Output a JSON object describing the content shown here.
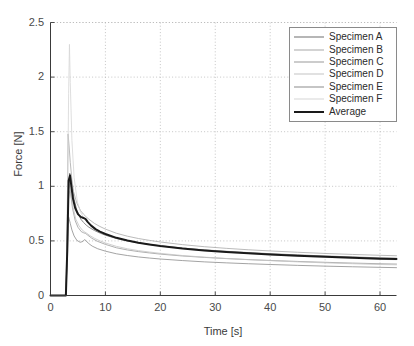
{
  "chart_data": {
    "type": "line",
    "title": "",
    "xlabel": "Time [s]",
    "ylabel": "Force [N]",
    "xlim": [
      0,
      63
    ],
    "ylim": [
      0,
      2.5
    ],
    "xticks": [
      0,
      10,
      20,
      30,
      40,
      50,
      60
    ],
    "xtick_labels": [
      "0",
      "10",
      "20",
      "30",
      "40",
      "50",
      "60"
    ],
    "yticks": [
      0,
      0.5,
      1,
      1.5,
      2,
      2.5
    ],
    "ytick_labels": [
      "0",
      "0.5",
      "1",
      "1.5",
      "2",
      "2.5"
    ],
    "grid": true,
    "grid_style": "dotted",
    "legend_position": "top-right",
    "background": "#ffffff",
    "series": [
      {
        "name": "Specimen A",
        "color": "#6e6e6e",
        "width": 0.8,
        "x": [
          0,
          1.0,
          2.0,
          2.8,
          3.0,
          3.2,
          3.5,
          3.8,
          4.0,
          4.3,
          4.8,
          5.5,
          6.0,
          6.5,
          7.0,
          8.0,
          9.0,
          10.0,
          12.0,
          14.0,
          16.0,
          18.0,
          20.0,
          24.0,
          28.0,
          32.0,
          36.0,
          40.0,
          45.0,
          50.0,
          55.0,
          60.0,
          63.0
        ],
        "y": [
          0.0,
          0.0,
          0.0,
          0.0,
          0.34,
          0.9,
          1.12,
          1.06,
          0.98,
          0.88,
          0.78,
          0.7,
          0.67,
          0.645,
          0.625,
          0.595,
          0.572,
          0.552,
          0.522,
          0.5,
          0.482,
          0.468,
          0.455,
          0.435,
          0.418,
          0.405,
          0.393,
          0.383,
          0.372,
          0.362,
          0.353,
          0.345,
          0.341
        ]
      },
      {
        "name": "Specimen B",
        "color": "#a8a8a8",
        "width": 0.8,
        "x": [
          0,
          1.0,
          2.0,
          2.8,
          3.0,
          3.2,
          3.4,
          3.6,
          3.9,
          4.2,
          4.8,
          5.5,
          6.0,
          6.5,
          7.0,
          8.0,
          9.0,
          10.0,
          12.0,
          14.0,
          16.0,
          18.0,
          20.0,
          24.0,
          28.0,
          32.0,
          36.0,
          40.0,
          45.0,
          50.0,
          55.0,
          60.0,
          63.0
        ],
        "y": [
          0.0,
          0.0,
          0.0,
          0.0,
          0.5,
          1.48,
          1.36,
          1.22,
          1.06,
          0.95,
          0.845,
          0.775,
          0.745,
          0.72,
          0.698,
          0.66,
          0.632,
          0.608,
          0.57,
          0.543,
          0.522,
          0.505,
          0.49,
          0.466,
          0.447,
          0.432,
          0.419,
          0.408,
          0.396,
          0.385,
          0.376,
          0.368,
          0.364
        ]
      },
      {
        "name": "Specimen C",
        "color": "#9a9a9a",
        "width": 0.8,
        "x": [
          0,
          1.0,
          2.0,
          2.8,
          3.05,
          3.25,
          3.45,
          3.7,
          4.0,
          4.5,
          5.0,
          5.6,
          6.0,
          6.4,
          6.8,
          7.5,
          8.5,
          10.0,
          12.0,
          14.0,
          16.0,
          18.0,
          20.0,
          24.0,
          28.0,
          32.0,
          36.0,
          40.0,
          45.0,
          50.0,
          55.0,
          60.0,
          63.0
        ],
        "y": [
          0.0,
          0.0,
          0.0,
          0.0,
          0.42,
          1.05,
          1.02,
          0.92,
          0.8,
          0.685,
          0.625,
          0.585,
          0.575,
          0.568,
          0.552,
          0.525,
          0.497,
          0.468,
          0.437,
          0.417,
          0.402,
          0.39,
          0.379,
          0.362,
          0.349,
          0.338,
          0.329,
          0.321,
          0.312,
          0.304,
          0.297,
          0.291,
          0.288
        ]
      },
      {
        "name": "Specimen D",
        "color": "#c4c4c4",
        "width": 0.8,
        "x": [
          0,
          1.0,
          2.0,
          2.8,
          3.1,
          3.3,
          3.5,
          3.8,
          4.1,
          4.6,
          5.2,
          5.8,
          6.2,
          6.6,
          7.2,
          8.0,
          9.0,
          10.0,
          12.0,
          14.0,
          16.0,
          18.0,
          20.0,
          24.0,
          28.0,
          32.0,
          36.0,
          40.0,
          45.0,
          50.0,
          55.0,
          60.0,
          63.0
        ],
        "y": [
          0.0,
          0.0,
          0.0,
          0.0,
          0.36,
          0.88,
          0.96,
          0.9,
          0.81,
          0.7,
          0.638,
          0.598,
          0.583,
          0.57,
          0.548,
          0.524,
          0.5,
          0.481,
          0.45,
          0.428,
          0.411,
          0.398,
          0.386,
          0.366,
          0.351,
          0.339,
          0.328,
          0.319,
          0.308,
          0.299,
          0.291,
          0.284,
          0.281
        ]
      },
      {
        "name": "Specimen E",
        "color": "#8c8c8c",
        "width": 0.8,
        "x": [
          0,
          1.0,
          2.0,
          2.8,
          3.0,
          3.3,
          3.6,
          3.9,
          4.3,
          4.8,
          5.4,
          5.9,
          6.2,
          6.5,
          6.9,
          7.6,
          8.6,
          10.0,
          12.0,
          14.0,
          16.0,
          18.0,
          20.0,
          24.0,
          28.0,
          32.0,
          36.0,
          40.0,
          45.0,
          50.0,
          55.0,
          60.0,
          63.0
        ],
        "y": [
          0.0,
          0.0,
          0.0,
          0.0,
          0.3,
          0.72,
          0.66,
          0.6,
          0.545,
          0.505,
          0.487,
          0.495,
          0.512,
          0.5,
          0.478,
          0.452,
          0.428,
          0.406,
          0.382,
          0.366,
          0.353,
          0.343,
          0.334,
          0.32,
          0.308,
          0.299,
          0.291,
          0.284,
          0.276,
          0.269,
          0.263,
          0.258,
          0.255
        ]
      },
      {
        "name": "Specimen F",
        "color": "#d6d6d6",
        "width": 0.8,
        "x": [
          0,
          1.0,
          2.0,
          2.8,
          3.05,
          3.3,
          3.45,
          3.6,
          3.9,
          4.3,
          4.9,
          5.5,
          6.0,
          6.5,
          7.2,
          8.0,
          9.0,
          10.0,
          12.0,
          14.0,
          16.0,
          18.0,
          20.0,
          24.0,
          28.0,
          32.0,
          36.0,
          40.0,
          45.0,
          50.0,
          55.0,
          60.0,
          63.0
        ],
        "y": [
          0.0,
          0.0,
          0.0,
          0.0,
          0.55,
          1.85,
          2.3,
          1.95,
          1.42,
          1.08,
          0.855,
          0.76,
          0.715,
          0.682,
          0.645,
          0.612,
          0.584,
          0.562,
          0.528,
          0.503,
          0.484,
          0.468,
          0.454,
          0.431,
          0.412,
          0.397,
          0.384,
          0.373,
          0.36,
          0.349,
          0.339,
          0.331,
          0.327
        ]
      },
      {
        "name": "Average",
        "color": "#1a1a1a",
        "width": 2.0,
        "x": [
          0,
          1.0,
          2.0,
          2.8,
          3.05,
          3.3,
          3.55,
          3.8,
          4.1,
          4.5,
          5.0,
          5.5,
          6.0,
          6.4,
          6.8,
          7.4,
          8.2,
          9.0,
          10.0,
          12.0,
          14.0,
          16.0,
          18.0,
          20.0,
          24.0,
          28.0,
          32.0,
          36.0,
          40.0,
          45.0,
          50.0,
          55.0,
          60.0,
          63.0
        ],
        "y": [
          0.0,
          0.0,
          0.0,
          0.0,
          0.41,
          1.05,
          1.1,
          1.0,
          0.885,
          0.8,
          0.745,
          0.72,
          0.71,
          0.7,
          0.672,
          0.64,
          0.608,
          0.585,
          0.563,
          0.528,
          0.503,
          0.483,
          0.467,
          0.453,
          0.43,
          0.412,
          0.398,
          0.386,
          0.376,
          0.364,
          0.354,
          0.345,
          0.337,
          0.334
        ]
      }
    ]
  },
  "axes": {
    "y_label": "Force [N]",
    "x_label": "Time [s]"
  },
  "legend": {
    "entries": [
      {
        "label": "Specimen A"
      },
      {
        "label": "Specimen B"
      },
      {
        "label": "Specimen C"
      },
      {
        "label": "Specimen D"
      },
      {
        "label": "Specimen E"
      },
      {
        "label": "Specimen F"
      },
      {
        "label": "Average"
      }
    ]
  },
  "colors": {
    "axis": "#3a3a3a",
    "grid": "#b6b6b6",
    "background": "#ffffff",
    "average": "#1a1a1a"
  }
}
